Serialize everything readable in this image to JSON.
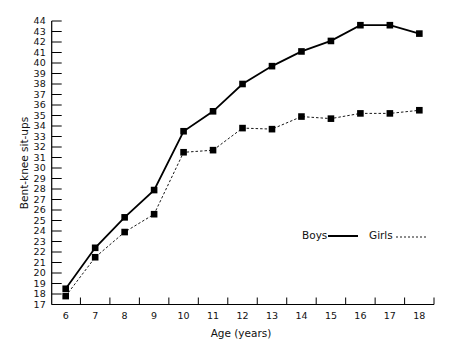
{
  "chart_data": {
    "type": "line",
    "title": "",
    "xlabel": "Age (years)",
    "ylabel": "Bent-knee sit-ups",
    "x": [
      6,
      7,
      8,
      9,
      10,
      11,
      12,
      13,
      14,
      15,
      16,
      17,
      18
    ],
    "xticks": [
      "6",
      "7",
      "8",
      "9",
      "10",
      "11",
      "12",
      "13",
      "14",
      "15",
      "16",
      "17",
      "18"
    ],
    "ylim": [
      17,
      44
    ],
    "yticks": [
      17,
      18,
      19,
      20,
      21,
      22,
      23,
      24,
      25,
      26,
      27,
      28,
      29,
      30,
      31,
      32,
      33,
      34,
      35,
      36,
      37,
      38,
      39,
      40,
      41,
      42,
      43,
      44
    ],
    "grid": false,
    "legend_position": "lower right (inside plot)",
    "series": [
      {
        "name": "Boys",
        "style": "solid",
        "marker": "square",
        "values": [
          18.5,
          22.4,
          25.3,
          27.9,
          33.5,
          35.4,
          38.0,
          39.7,
          41.1,
          42.1,
          43.6,
          43.6,
          42.8
        ]
      },
      {
        "name": "Girls",
        "style": "dashed",
        "marker": "square",
        "values": [
          17.8,
          21.5,
          23.9,
          25.6,
          31.5,
          31.7,
          33.8,
          33.7,
          34.9,
          34.7,
          35.2,
          35.2,
          35.5
        ]
      }
    ]
  },
  "legend": {
    "boys_label": "Boys",
    "girls_label": "Girls"
  },
  "axes": {
    "x_title": "Age (years)",
    "y_title": "Bent-knee sit-ups"
  }
}
